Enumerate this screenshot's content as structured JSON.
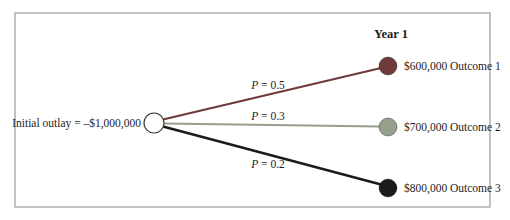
{
  "diagram": {
    "header": "Year 1",
    "root": {
      "label": "Initial outlay = –$1,000,000",
      "node_fill": "#ffffff",
      "node_stroke": "#3a3a3a"
    },
    "branches": [
      {
        "prob_symbol": "P",
        "prob_value": " = 0.5",
        "outcome": "$600,000 Outcome 1",
        "color": "#6e3a3a"
      },
      {
        "prob_symbol": "P",
        "prob_value": " = 0.3",
        "outcome": "$700,000 Outcome 2",
        "color": "#95a08d"
      },
      {
        "prob_symbol": "P",
        "prob_value": " = 0.2",
        "outcome": "$800,000 Outcome 3",
        "color": "#1b1b1b"
      }
    ],
    "frame_color": "#9a9a9a"
  }
}
